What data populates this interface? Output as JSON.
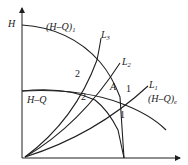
{
  "diagram": {
    "type": "pump-system-curves",
    "axes": {
      "y_label": "H",
      "x_label": "Q"
    },
    "curves": [
      {
        "id": "HQ_combined",
        "label": "(H–Q)",
        "subscript": "1",
        "description": "upper pump head curve"
      },
      {
        "id": "HQ_single",
        "label": "H–Q",
        "subscript": "",
        "description": "single pump head curve"
      },
      {
        "id": "HQ_system",
        "label": "(H–Q)",
        "subscript": "e",
        "description": "equivalent head curve"
      },
      {
        "id": "L1",
        "label": "L",
        "subscript": "1",
        "description": "pipeline characteristic 1"
      },
      {
        "id": "L2",
        "label": "L",
        "subscript": "2",
        "description": "pipeline characteristic 2"
      },
      {
        "id": "L3",
        "label": "L",
        "subscript": "3",
        "description": "pipeline characteristic 3"
      }
    ],
    "points": [
      {
        "label": "A",
        "description": "operating point"
      },
      {
        "label": "1",
        "description": "intersection on L1 with (H-Q)e"
      },
      {
        "label": "1",
        "description": "intersection lower on L1"
      },
      {
        "label": "2",
        "description": "intersection upper on L3"
      },
      {
        "label": "2",
        "description": "intersection lower on L3"
      }
    ]
  }
}
